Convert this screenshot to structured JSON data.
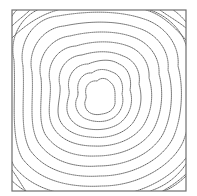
{
  "diagram": {
    "type": "contour-map",
    "frame": {
      "x": 12,
      "y": 10,
      "width": 174,
      "height": 181,
      "stroke": "#6e6e6e"
    },
    "line_color": "#555555",
    "line_style": "dotted",
    "center": {
      "x": 100,
      "y": 97
    },
    "contours": [
      {
        "level": 1,
        "d": "M86,95 C84,86 90,80 97,81 C101,77 107,78 110,82 C116,86 115,95 115,100 C116,108 110,113 102,114 C94,116 86,113 85,105 C84,101 87,99 86,95 Z"
      },
      {
        "level": 2,
        "d": "M78,92 C76,80 84,72 92,73 C98,68 106,69 112,72 C121,75 124,85 122,94 C125,104 120,115 111,119 C103,123 92,122 84,118 C76,113 74,104 77,98 C78,96 78,94 78,92 Z"
      },
      {
        "level": 3,
        "d": "M69,90 C66,75 76,64 88,64 C98,60 110,58 119,64 C129,68 132,80 130,90 C134,102 130,115 120,123 C110,130 96,131 84,128 C73,125 66,116 67,106 C67,100 70,95 69,90 Z"
      },
      {
        "level": 4,
        "d": "M60,86 C56,70 67,56 82,55 C95,51 110,50 123,56 C135,60 141,72 139,84 C143,98 141,112 132,124 C122,135 106,139 90,137 C76,136 63,130 59,118 C56,108 61,96 60,86 Z"
      },
      {
        "level": 5,
        "d": "M50,82 C46,64 58,47 76,46 C92,41 112,40 128,46 C142,51 150,64 149,78 C154,94 152,112 143,126 C133,140 114,147 94,146 C76,146 59,140 52,125 C46,112 52,96 50,82 Z"
      },
      {
        "level": 6,
        "d": "M41,78 C36,58 50,38 70,36 C90,31 114,30 133,37 C150,43 160,58 159,74 C164,92 162,114 153,130 C142,147 120,156 96,156 C74,157 55,150 45,134 C37,118 43,96 41,78 Z"
      },
      {
        "level": 7,
        "d": "M32,72 C27,50 42,28 64,26 C88,21 116,20 138,28 C158,34 170,52 168,70 C174,90 172,116 163,134 C152,154 126,166 98,166 C72,168 50,160 38,142 C28,124 34,98 32,72 Z"
      },
      {
        "level": 8,
        "d": "M23,66 C18,42 34,18 58,16 C86,11 118,10 144,19 C166,26 180,46 178,66 C184,88 182,118 173,138 C162,160 132,176 100,176 C70,178 44,170 30,150 C19,130 25,98 23,66 Z"
      },
      {
        "level": 9,
        "d": "M14,60 C8,34 26,8 52,6 C84,1 120,0 150,10 C174,18 190,40 188,62 C194,86 192,120 183,142 C172,166 138,186 102,186 C68,188 38,180 22,158 C10,136 16,98 14,60 Z"
      },
      {
        "level": 10,
        "d": "M6,54 C-2,26 18,-2 46,-4 C82,-9 124,-10 156,1 C182,10 200,34 198,58 C204,84 202,122 193,146 C182,172 144,196 104,196 C66,198 32,190 14,166 C1,142 8,98 6,54 Z"
      },
      {
        "level": 11,
        "d": "M-2,48 C-12,18 10,-12 40,-14 C80,-19 128,-20 162,-8 C190,2 210,28 208,54 C214,82 212,124 203,150 C192,178 150,206 106,206 C64,208 26,200 6,174 C-8,148 0,98 -2,48 Z"
      }
    ],
    "corner_fragments": [
      {
        "position": "top-left",
        "d": "M12,26 C18,20 24,16 30,10"
      },
      {
        "position": "top-left",
        "d": "M12,38 C20,30 30,22 42,16 C48,13 54,11 58,10"
      },
      {
        "position": "top-right",
        "d": "M160,10 C168,16 176,20 186,28"
      },
      {
        "position": "top-right",
        "d": "M146,10 C160,14 172,24 186,40"
      },
      {
        "position": "bottom-left",
        "d": "M12,170 C18,178 22,186 26,191"
      },
      {
        "position": "bottom-right",
        "d": "M186,176 C180,182 172,188 164,191"
      },
      {
        "position": "bottom-right",
        "d": "M186,164 C178,176 166,186 150,191"
      }
    ]
  }
}
